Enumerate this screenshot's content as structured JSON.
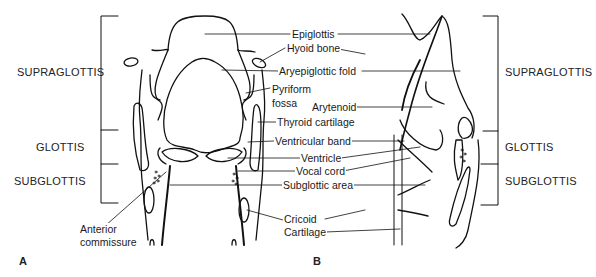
{
  "figure": {
    "panels": [
      {
        "id": "A",
        "label": "A"
      },
      {
        "id": "B",
        "label": "B"
      }
    ],
    "regions_left": [
      "SUPRAGLOTTIS",
      "GLOTTIS",
      "SUBGLOTTIS"
    ],
    "regions_right": [
      "SUPRAGLOTTIS",
      "GLOTTIS",
      "SUBGLOTTIS"
    ],
    "labels": {
      "epiglottis": "Epiglottis",
      "hyoid_bone": "Hyoid bone",
      "aryepiglottic_fold": "Aryepiglottic fold",
      "pyriform_fossa_1": "Pyriform",
      "pyriform_fossa_2": "fossa",
      "arytenoid": "Arytenoid",
      "thyroid_cartilage": "Thyroid cartilage",
      "ventricular_band": "Ventricular band",
      "ventricle": "Ventricle",
      "vocal_cord": "Vocal cord",
      "subglottic_area": "Subglottic area",
      "cricoid_1": "Cricoid",
      "cricoid_2": "Cartilage",
      "anterior_commissure_1": "Anterior",
      "anterior_commissure_2": "commissure"
    }
  }
}
